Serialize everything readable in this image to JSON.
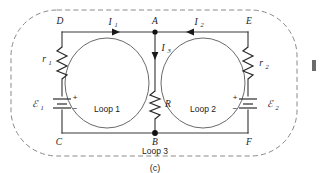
{
  "figure": {
    "caption": "(c)",
    "boundary": "dashed-rounded-rectangle"
  },
  "nodes": {
    "top_left": "D",
    "top_mid": "A",
    "top_right": "E",
    "bottom_left": "C",
    "bottom_mid": "B",
    "bottom_right": "F"
  },
  "currents": [
    {
      "symbol": "I",
      "subscript": "1",
      "direction": "right",
      "branch": "D-to-A"
    },
    {
      "symbol": "I",
      "subscript": "2",
      "direction": "left",
      "branch": "E-to-A"
    },
    {
      "symbol": "I",
      "subscript": "3",
      "direction": "down",
      "branch": "A-to-B"
    }
  ],
  "components": [
    {
      "type": "resistor",
      "symbol": "r",
      "subscript": "1",
      "branch": "D-to-C",
      "side": "left"
    },
    {
      "type": "resistor",
      "symbol": "r",
      "subscript": "2",
      "branch": "E-to-F",
      "side": "right"
    },
    {
      "type": "resistor",
      "symbol": "R",
      "subscript": "",
      "branch": "A-to-B",
      "side": "middle"
    },
    {
      "type": "battery",
      "symbol": "ℰ",
      "subscript": "1",
      "branch": "D-to-C",
      "plus": "+",
      "minus": "−",
      "plus_position": "top"
    },
    {
      "type": "battery",
      "symbol": "ℰ",
      "subscript": "2",
      "branch": "E-to-F",
      "plus": "+",
      "minus": "−",
      "plus_position": "top"
    }
  ],
  "loops": [
    {
      "label": "Loop 1",
      "position": "left-mesh"
    },
    {
      "label": "Loop 2",
      "position": "right-mesh"
    },
    {
      "label": "Loop 3",
      "position": "outer-below"
    }
  ],
  "colors": {
    "wire": "#3a3a3a",
    "text": "#1a1a1a",
    "loop_outline": "#6a6a6a",
    "boundary": "#8a8a8a",
    "node": "#111111",
    "background": "#ffffff"
  }
}
